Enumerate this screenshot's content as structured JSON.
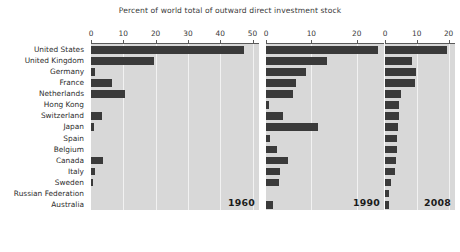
{
  "chart_data": {
    "type": "bar",
    "title": "Percent of world total of outward direct investment stock",
    "xlabel": "Percent of world total of outward direct investment stock",
    "ylabel": "",
    "orientation": "horizontal",
    "grid": true,
    "legend": "none",
    "bar_color": "#3a3a3a",
    "panel_background": "#d8d8d8",
    "categories": [
      "United States",
      "United Kingdom",
      "Germany",
      "France",
      "Netherlands",
      "Hong Kong",
      "Switzerland",
      "Japan",
      "Spain",
      "Belgium",
      "Canada",
      "Italy",
      "Sweden",
      "Russian Federation",
      "Australia"
    ],
    "panels": [
      {
        "name": "1960",
        "year_label": "1960",
        "xlim": [
          0,
          52
        ],
        "xticks": [
          0,
          10,
          20,
          30,
          40,
          50
        ],
        "xticklabels": [
          "0",
          "10",
          "20",
          "30",
          "40",
          "50"
        ],
        "values": [
          47.5,
          19.5,
          1.2,
          6.5,
          10.5,
          0.0,
          3.5,
          0.8,
          0.0,
          0.0,
          3.8,
          1.3,
          0.7,
          0.0,
          0.0
        ]
      },
      {
        "name": "1990",
        "year_label": "1990",
        "xlim": [
          0,
          26
        ],
        "xticks": [
          0,
          10,
          20
        ],
        "xticklabels": [
          "0",
          "10",
          "20"
        ],
        "values": [
          24.6,
          13.4,
          8.8,
          6.5,
          6.0,
          0.7,
          3.8,
          11.5,
          0.8,
          2.5,
          4.8,
          3.0,
          2.9,
          0.0,
          1.5
        ]
      },
      {
        "name": "2008",
        "year_label": "2008",
        "xlim": [
          0,
          22
        ],
        "xticks": [
          0,
          10,
          20
        ],
        "xticklabels": [
          "0",
          "10",
          "20"
        ],
        "values": [
          19.6,
          8.5,
          9.6,
          9.5,
          5.0,
          4.5,
          4.3,
          4.2,
          3.9,
          3.7,
          3.3,
          3.0,
          1.8,
          1.4,
          1.3
        ]
      }
    ]
  }
}
